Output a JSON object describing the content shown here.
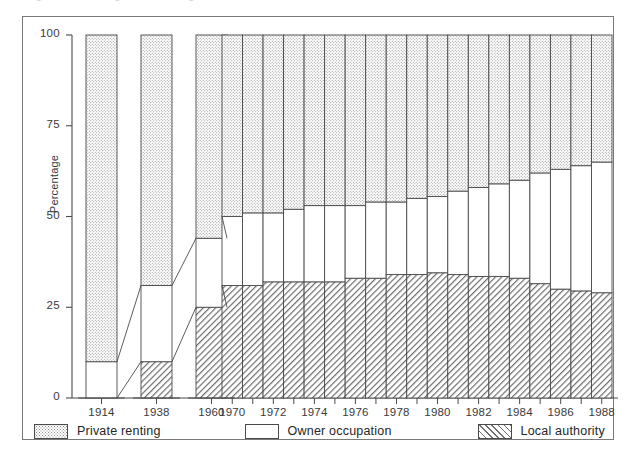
{
  "top_caption": "Figure — Housing tenure in England and Wales",
  "chart_data": {
    "type": "bar",
    "subtype": "stacked-percentage-bar",
    "title": "",
    "xlabel": "",
    "ylabel": "Percentage",
    "ylim": [
      0,
      100
    ],
    "yticks": [
      0,
      25,
      50,
      75,
      100
    ],
    "ytick_labels": [
      "0",
      "25",
      "50",
      "75",
      "100"
    ],
    "grid": false,
    "legend_position": "bottom",
    "categories": [
      "1914",
      "1938",
      "1960",
      "1970",
      "1971",
      "1972",
      "1973",
      "1974",
      "1975",
      "1976",
      "1977",
      "1978",
      "1979",
      "1980",
      "1981",
      "1982",
      "1983",
      "1984",
      "1985",
      "1986",
      "1987",
      "1988"
    ],
    "xtick_labels": [
      "1914",
      "1938",
      "1960",
      "1970",
      "1972",
      "1974",
      "1976",
      "1978",
      "1980",
      "1982",
      "1984",
      "1986",
      "1988"
    ],
    "series": [
      {
        "name": "Local authority",
        "pattern": "diagonal-hatch",
        "color": "#6e6e6e",
        "values": [
          0,
          10,
          25,
          31,
          31,
          32,
          32,
          32,
          32,
          33,
          33,
          34,
          34,
          34.5,
          34,
          33.5,
          33.5,
          33,
          31.5,
          30,
          29.5,
          29
        ]
      },
      {
        "name": "Owner occupation",
        "pattern": "solid-white",
        "color": "#ffffff",
        "values": [
          10,
          31,
          44,
          50,
          51,
          51,
          52,
          53,
          53,
          53,
          54,
          54,
          55,
          55.5,
          57,
          58,
          59,
          60,
          62,
          63,
          64,
          65
        ]
      },
      {
        "name": "Private renting",
        "pattern": "stipple-dots",
        "color": "#8d8d8d",
        "values": [
          90,
          59,
          31,
          19,
          18,
          17,
          16,
          15,
          15,
          14,
          13,
          12,
          11,
          10,
          9,
          8.5,
          7.5,
          7,
          6.5,
          7,
          6.5,
          6
        ]
      }
    ],
    "cumulative_tops": {
      "local_authority": [
        0,
        10,
        25,
        31,
        31,
        32,
        32,
        32,
        32,
        33,
        33,
        34,
        34,
        34.5,
        34,
        33.5,
        33.5,
        33,
        31.5,
        30,
        29.5,
        29
      ],
      "owner_occupation": [
        10,
        41,
        69,
        81,
        82,
        83,
        84,
        85,
        85,
        86,
        87,
        88,
        89,
        90,
        91,
        91.5,
        92.5,
        93,
        93.5,
        93,
        93.5,
        94
      ]
    },
    "annotations": [
      "Connector lines join the 1914, 1938 and 1960 bars to the 1970 block",
      "1914, 1938 and 1960 bars are separated; 1970-1988 bars are contiguous"
    ]
  },
  "legend": {
    "items": [
      {
        "label": "Private renting",
        "pattern": "stipple-dots"
      },
      {
        "label": "Owner occupation",
        "pattern": "solid-white"
      },
      {
        "label": "Local authority",
        "pattern": "diagonal-hatch"
      }
    ]
  }
}
